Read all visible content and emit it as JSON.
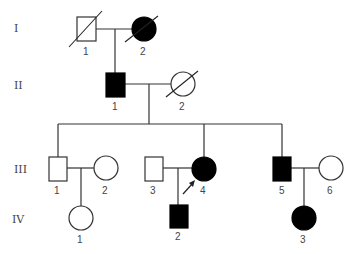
{
  "generations": [
    {
      "label": "I",
      "y": 28
    },
    {
      "label": "II",
      "y": 85
    },
    {
      "label": "III",
      "y": 169
    },
    {
      "label": "IV",
      "y": 219
    }
  ],
  "individuals": {
    "I_1": {
      "label": "1",
      "sex": "male",
      "affected": false,
      "deceased": true
    },
    "I_2": {
      "label": "2",
      "sex": "female",
      "affected": true,
      "deceased": true
    },
    "II_1": {
      "label": "1",
      "sex": "male",
      "affected": true,
      "deceased": false
    },
    "II_2": {
      "label": "2",
      "sex": "female",
      "affected": false,
      "deceased": true
    },
    "III_1": {
      "label": "1",
      "sex": "male",
      "affected": false,
      "deceased": false
    },
    "III_2": {
      "label": "2",
      "sex": "female",
      "affected": false,
      "deceased": false
    },
    "III_3": {
      "label": "3",
      "sex": "male",
      "affected": false,
      "deceased": false
    },
    "III_4": {
      "label": "4",
      "sex": "female",
      "affected": true,
      "deceased": false,
      "proband": true
    },
    "III_5": {
      "label": "5",
      "sex": "male",
      "affected": true,
      "deceased": false
    },
    "III_6": {
      "label": "6",
      "sex": "female",
      "affected": false,
      "deceased": false
    },
    "IV_1": {
      "label": "1",
      "sex": "female",
      "affected": false,
      "deceased": false
    },
    "IV_2": {
      "label": "2",
      "sex": "male",
      "affected": true,
      "deceased": false
    },
    "IV_3": {
      "label": "3",
      "sex": "female",
      "affected": true,
      "deceased": false
    }
  },
  "colors": {
    "affected": "#000000",
    "unaffected": "#ffffff",
    "line": "#333333"
  }
}
